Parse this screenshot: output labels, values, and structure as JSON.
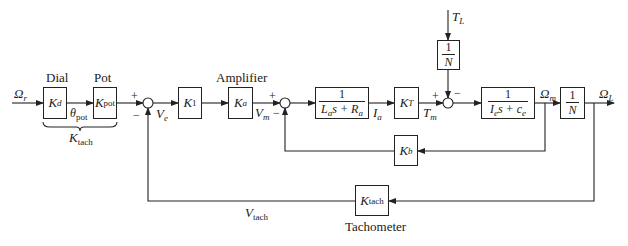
{
  "diagram": {
    "type": "block-diagram",
    "signals": {
      "input": {
        "sym": "Ω",
        "sub": "r"
      },
      "theta_pot": {
        "sym": "θ",
        "sub": "pot"
      },
      "v_e": {
        "sym": "V",
        "sub": "e"
      },
      "v_m": {
        "sym": "V",
        "sub": "m"
      },
      "i_a": {
        "sym": "I",
        "sub": "a"
      },
      "t_m": {
        "sym": "T",
        "sub": "m"
      },
      "t_l": {
        "sym": "T",
        "sub": "L"
      },
      "omega_m": {
        "sym": "Ω",
        "sub": "m"
      },
      "omega_l": {
        "sym": "Ω",
        "sub": "L"
      },
      "v_tach": {
        "sym": "V",
        "sub": "tach"
      }
    },
    "blocks": {
      "dial": {
        "caption": "Dial",
        "sym": "K",
        "sub": "d"
      },
      "pot": {
        "caption": "Pot",
        "sym": "K",
        "sub": "pot"
      },
      "k1": {
        "sym": "K",
        "sub": "1"
      },
      "amplifier": {
        "caption": "Amplifier",
        "sym": "K",
        "sub": "a"
      },
      "armature": {
        "num": "1",
        "den": "L<sub>a</sub>s + R<sub>a</sub>"
      },
      "torque_const": {
        "sym": "K",
        "sub": "T"
      },
      "load_gear": {
        "num": "1",
        "den": "N"
      },
      "mechanical": {
        "num": "1",
        "den": "I<sub>e</sub>s + c<sub>e</sub>"
      },
      "gear": {
        "num": "1",
        "den": "N"
      },
      "back_emf": {
        "sym": "K",
        "sub": "b"
      },
      "tachometer": {
        "caption": "Tachometer",
        "sym": "K",
        "sub": "tach"
      }
    },
    "brace_label": {
      "sym": "K",
      "sub": "tach"
    },
    "summing_junctions": [
      {
        "id": "sum1",
        "plus": "+",
        "minus": "−"
      },
      {
        "id": "sum2",
        "plus": "+",
        "minus": "−"
      },
      {
        "id": "sum3",
        "plus": "+",
        "minus": "−"
      }
    ],
    "colors": {
      "line": "#222222",
      "background": "#ffffff"
    }
  }
}
